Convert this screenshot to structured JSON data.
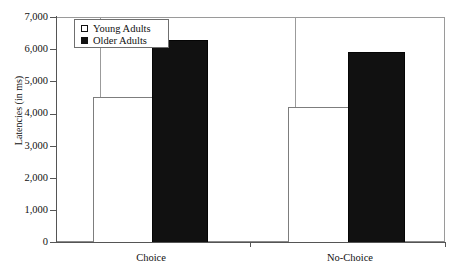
{
  "chart_data": {
    "type": "bar",
    "title": "",
    "xlabel": "",
    "ylabel": "Latencies (in ms)",
    "categories": [
      "Choice",
      "No-Choice"
    ],
    "series": [
      {
        "name": "Young Adults",
        "values": [
          4500,
          4200
        ],
        "fill": "open",
        "color": "#ffffff"
      },
      {
        "name": "Older Adults",
        "values": [
          6300,
          5900
        ],
        "fill": "solid",
        "color": "#111111"
      }
    ],
    "ylim": [
      0,
      7000
    ],
    "yticks": [
      0,
      1000,
      2000,
      3000,
      4000,
      5000,
      6000,
      7000
    ],
    "ytick_labels": [
      "0",
      "1,000",
      "2,000",
      "3,000",
      "4,000",
      "5,000",
      "6,000",
      "7,000"
    ],
    "grid": false,
    "legend_position": "top-left",
    "frame": true
  },
  "legend": {
    "entries": [
      {
        "label": "Young Adults",
        "marker": "open-square-marker"
      },
      {
        "label": "Older Adults",
        "marker": "filled-square-marker"
      }
    ]
  },
  "axes": {
    "y_title": "Latencies (in ms)",
    "y_tick_labels": [
      "7,000",
      "6,000",
      "5,000",
      "4,000",
      "3,000",
      "2,000",
      "1,000",
      "0"
    ],
    "x_tick_labels": [
      "Choice",
      "No-Choice"
    ]
  }
}
